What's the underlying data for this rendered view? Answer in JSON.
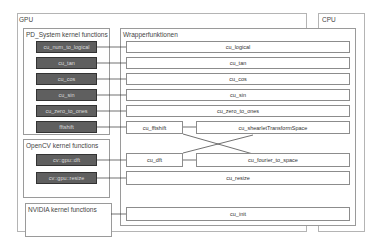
{
  "diagram": {
    "gpu": {
      "label": "GPU"
    },
    "cpu": {
      "label": "CPU"
    },
    "pd_system": {
      "label": "PD_System kernel functions",
      "items": [
        "cu_num_to_logical",
        "cu_tan",
        "cu_cos",
        "cu_sin",
        "cu_zero_to_ones",
        "fftshift"
      ]
    },
    "opencv": {
      "label": "OpenCV kernel functions",
      "items": [
        "cv::gpu::dft",
        "cv::gpu::resize"
      ]
    },
    "nvidia": {
      "label": "NVIDIA kernel functions"
    },
    "wrapper": {
      "label": "Wrapperfunktionen",
      "items": {
        "logical": "cu_logical",
        "tan": "cu_tan",
        "cos": "cu_cos",
        "sin": "cu_sin",
        "zero_to_ones": "cu_zero_to_ones",
        "fftshift": "cu_fftshift",
        "shearlet": "cu_shearletTransformSpace",
        "dft": "cu_dft",
        "fourier": "cu_fourier_to_space",
        "resize": "cu_resize",
        "init": "cu_init"
      }
    },
    "colors": {
      "kernel_box_fill": "#5f5f5f",
      "wrapper_box_fill": "#ffffff",
      "frame_border": "#9a9a9a",
      "line": "#333333"
    }
  }
}
